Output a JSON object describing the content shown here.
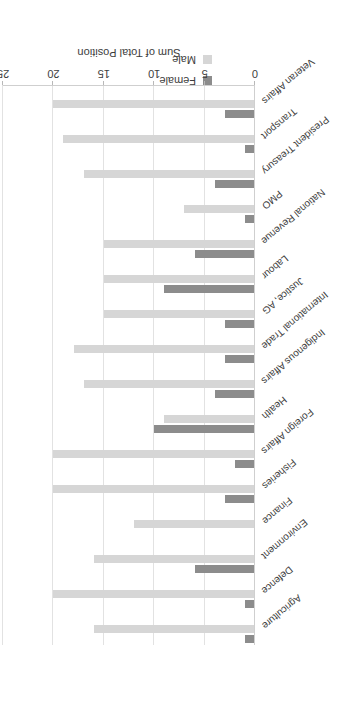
{
  "chart_data": {
    "type": "bar",
    "orientation": "horizontal",
    "title": "",
    "xlabel": "Sum of Total Position",
    "ylabel": "",
    "xlim": [
      0,
      25
    ],
    "xticks": [
      0,
      5,
      10,
      15,
      20,
      25
    ],
    "grid": true,
    "legend_position": "top-center",
    "categories": [
      "Agriculture",
      "Defence",
      "Environment",
      "Finance",
      "Fisheries",
      "Foreign Affairs",
      "Health",
      "Indigenous Affairs",
      "International Trade",
      "Justice, AG",
      "Labour",
      "National Revenue",
      "PMO",
      "President Treasury",
      "Transport",
      "Veteran Affairs"
    ],
    "series": [
      {
        "name": "Female",
        "color": "#8c8c8c",
        "values": [
          1,
          1,
          6,
          0,
          3,
          2,
          10,
          4,
          3,
          3,
          9,
          6,
          1,
          4,
          1,
          3
        ]
      },
      {
        "name": "Male",
        "color": "#d6d6d6",
        "values": [
          16,
          20,
          16,
          12,
          20,
          20,
          9,
          17,
          18,
          15,
          15,
          15,
          7,
          17,
          19,
          20
        ]
      }
    ]
  },
  "legend": {
    "items": [
      {
        "label": "Female",
        "color": "#8c8c8c"
      },
      {
        "label": "Male",
        "color": "#d6d6d6"
      }
    ]
  },
  "axis": {
    "title": "Sum of Total Position",
    "ticks": [
      "0",
      "5",
      "10",
      "15",
      "20",
      "25"
    ]
  }
}
